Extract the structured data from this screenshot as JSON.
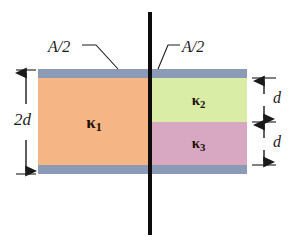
{
  "figure": {
    "colors": {
      "background": "#ffffff",
      "plate": "#8c9bb5",
      "k1_block": "#f6b584",
      "k2_block": "#d9eda6",
      "k3_block": "#d8a8c2",
      "line": "#0c0c0c",
      "text": "#1a1a1a",
      "label_text": "#201008"
    },
    "center_line": {
      "name": "central-divider-line",
      "orientation": "vertical"
    },
    "plates": [
      {
        "name": "top-plate",
        "position": "top"
      },
      {
        "name": "bottom-plate",
        "position": "bottom"
      }
    ],
    "blocks": [
      {
        "id": "k1",
        "symbol": "κ",
        "subscript": "1",
        "label": "κ",
        "color": "#f6b584",
        "thickness": "2d",
        "side": "left"
      },
      {
        "id": "k2",
        "symbol": "κ",
        "subscript": "2",
        "label": "κ",
        "color": "#d9eda6",
        "thickness": "d",
        "side": "right-top"
      },
      {
        "id": "k3",
        "symbol": "κ",
        "subscript": "3",
        "label": "κ",
        "color": "#d8a8c2",
        "thickness": "d",
        "side": "right-bottom"
      }
    ],
    "area_labels": [
      {
        "name": "area-label-left",
        "text": "A/2",
        "side": "left"
      },
      {
        "name": "area-label-right",
        "text": "A/2",
        "side": "right"
      }
    ],
    "dimensions": [
      {
        "name": "dim-2d",
        "text": "2d",
        "side": "left",
        "spans": "full height"
      },
      {
        "name": "dim-d-top",
        "text": "d",
        "side": "right",
        "spans": "k2 height"
      },
      {
        "name": "dim-d-bottom",
        "text": "d",
        "side": "right",
        "spans": "k3 height"
      }
    ]
  }
}
